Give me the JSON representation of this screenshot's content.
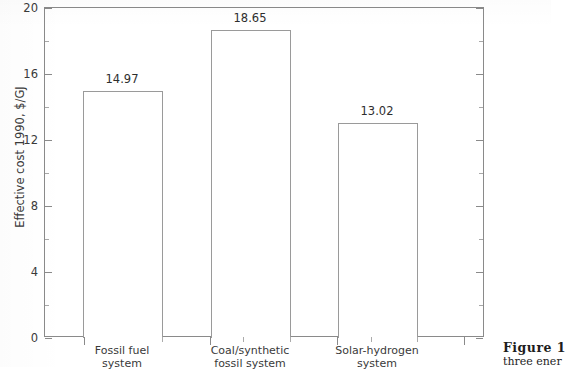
{
  "chart_data": {
    "type": "bar",
    "title": "",
    "xlabel": "",
    "ylabel": "Effective cost 1990, $/GJ",
    "ylim": [
      0,
      20
    ],
    "ytick_values": [
      0,
      4,
      8,
      12,
      16,
      20
    ],
    "ytick_labels": [
      "0",
      "4",
      "8",
      "12",
      "16",
      "20"
    ],
    "yminor_values": [
      2,
      6,
      10,
      14,
      18
    ],
    "grid": false,
    "legend": false,
    "categories": [
      "Fossil fuel system",
      "Coal/synthetic fossil system",
      "Solar-hydrogen system"
    ],
    "category_lines": [
      [
        "Fossil fuel",
        "system"
      ],
      [
        "Coal/synthetic",
        "fossil system"
      ],
      [
        "Solar-hydrogen",
        "system"
      ]
    ],
    "values": [
      14.97,
      18.65,
      13.02
    ],
    "value_labels": [
      "14.97",
      "18.65",
      "13.02"
    ],
    "bar_style": {
      "fill": "#ffffff",
      "edge": "#9a9a9a"
    }
  },
  "axis": {
    "frame_color": "#8a8a8a"
  },
  "caption": {
    "title": "Figure 1",
    "body": "three ener"
  }
}
